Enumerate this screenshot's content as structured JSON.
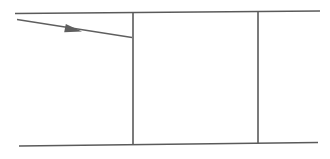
{
  "canvas": {
    "width": 330,
    "height": 159,
    "background_color": "#ffffff",
    "title": "",
    "description": "Line drawing: two near-horizontal rails crossed by two vertical dividers, with a right-pointing arrow in the left cell"
  },
  "style": {
    "stroke_color": "#5a5a5a",
    "arrow_stroke_color": "#5f5f5f",
    "stroke_width": 1.6,
    "vertical_stroke_width": 1.6,
    "arrow_stroke_width": 1.3
  },
  "shapes": {
    "top_rail": {
      "label": "top-rail",
      "x1": 15,
      "y1": 13.5,
      "x2": 320,
      "y2": 11.0
    },
    "bottom_rail": {
      "label": "bottom-rail",
      "x1": 19,
      "y1": 146.0,
      "x2": 318,
      "y2": 142.5
    },
    "divider_left": {
      "label": "vertical-divider-left",
      "x1": 133,
      "y1": 12.5,
      "x2": 133,
      "y2": 144.8
    },
    "divider_right": {
      "label": "vertical-divider-right",
      "x1": 258,
      "y1": 11.5,
      "x2": 258,
      "y2": 143.5
    },
    "arrow": {
      "label": "arrow-right",
      "x1": 17,
      "y1": 19.5,
      "x2": 132,
      "y2": 37.5,
      "head": {
        "tip_x": 82,
        "tip_y": 31.5,
        "back_x": 65,
        "back_y": 28.2,
        "half_width": 4.2
      }
    }
  }
}
